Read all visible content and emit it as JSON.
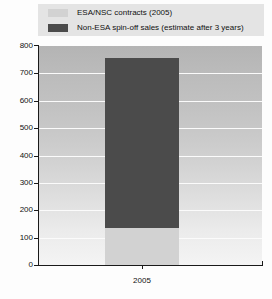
{
  "chart_data": {
    "type": "bar",
    "subtype": "stacked-bar",
    "title": "",
    "xlabel": "",
    "ylabel": "",
    "categories": [
      "2005"
    ],
    "series": [
      {
        "name": "ESA/NSC contracts (2005)",
        "color": "#d2d2d2",
        "values": [
          135
        ]
      },
      {
        "name": "Non-ESA spin-off sales (estimate after 3 years)",
        "color": "#4b4b4b",
        "values": [
          620
        ]
      }
    ],
    "stack_totals": [
      755
    ],
    "ylim": [
      0,
      800
    ],
    "yticks": [
      0,
      100,
      200,
      300,
      400,
      500,
      600,
      700,
      800
    ],
    "ytick_labels": [
      "0",
      "100",
      "200",
      "300",
      "400",
      "500",
      "600",
      "700",
      "800"
    ],
    "xtick_labels": [
      "2005"
    ],
    "grid": true,
    "grid_axis": "y",
    "grid_color": "#fbfbfb",
    "legend_position": "top",
    "plot_background": "gradient-gray-vertical",
    "axis_color": "#1a1a1a"
  },
  "legend": {
    "background": "#e4e4e4",
    "entries": [
      {
        "label": "ESA/NSC contracts (2005)",
        "swatch": "light-gray-swatch",
        "color": "#d2d2d2"
      },
      {
        "label": "Non-ESA spin-off sales (estimate after 3 years)",
        "swatch": "dark-gray-swatch",
        "color": "#4b4b4b"
      }
    ]
  },
  "axes": {
    "y": {
      "labels": [
        "800",
        "700",
        "600",
        "500",
        "400",
        "300",
        "200",
        "100",
        "0"
      ]
    },
    "x": {
      "labels": [
        "2005"
      ]
    }
  }
}
